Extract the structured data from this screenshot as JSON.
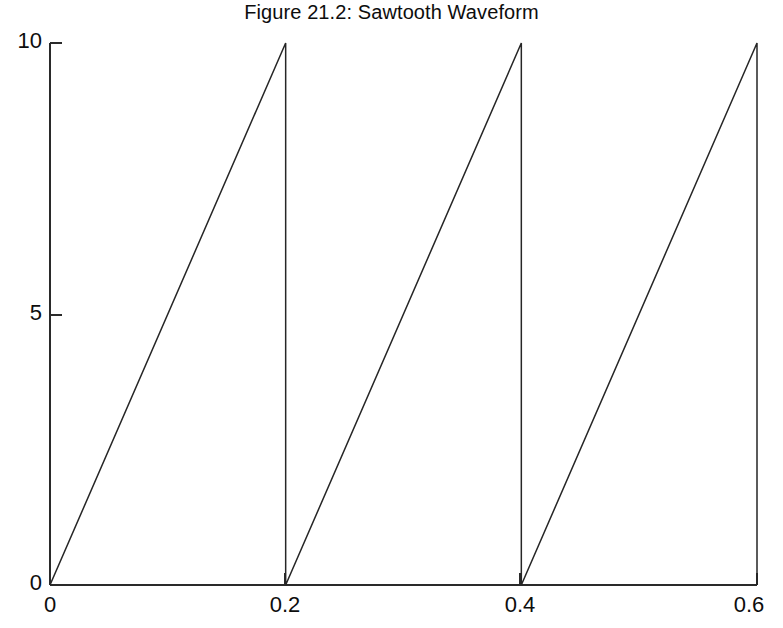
{
  "figure": {
    "title": "Figure 21.2: Sawtooth Waveform",
    "background_color": "#ffffff",
    "line_color": "#262626",
    "axis_color": "#2a2a2a",
    "text_color": "#0d0d0d"
  },
  "axes": {
    "y": {
      "ticks": [
        {
          "value": 0,
          "label": "0"
        },
        {
          "value": 5,
          "label": "5"
        },
        {
          "value": 10,
          "label": "10"
        }
      ],
      "range": [
        0,
        10
      ],
      "label": ""
    },
    "x": {
      "ticks": [
        {
          "value": 0,
          "label": "0"
        },
        {
          "value": 0.2,
          "label": "0.2"
        },
        {
          "value": 0.4,
          "label": "0.4"
        },
        {
          "value": 0.6,
          "label": "0.6"
        }
      ],
      "range": [
        0,
        0.6
      ],
      "label": ""
    }
  },
  "chart_data": {
    "type": "line",
    "title": "Figure 21.2: Sawtooth Waveform",
    "xlabel": "",
    "ylabel": "",
    "xlim": [
      0,
      0.6
    ],
    "ylim": [
      0,
      10
    ],
    "grid": false,
    "legend": false,
    "xticks": [
      0,
      0.2,
      0.4,
      0.6
    ],
    "xticklabels": [
      "0",
      "0.2",
      "0.4",
      "0.6"
    ],
    "yticks": [
      0,
      5,
      10
    ],
    "yticklabels": [
      "0",
      "5",
      "10"
    ],
    "waveform": "sawtooth",
    "amplitude": 10,
    "period": 0.2,
    "frequency": 5,
    "cycles": 3,
    "series": [
      {
        "name": "sawtooth",
        "x": [
          0,
          0.2,
          0.2,
          0.4,
          0.4,
          0.6,
          0.6
        ],
        "y": [
          0,
          10,
          0,
          10,
          0,
          10,
          0
        ]
      }
    ]
  }
}
